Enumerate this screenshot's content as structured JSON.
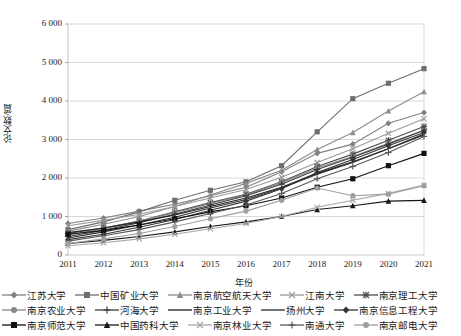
{
  "chart_data": {
    "type": "line",
    "title": "",
    "xlabel": "年份",
    "ylabel": "论文数/篇",
    "x": [
      2011,
      2012,
      2013,
      2014,
      2015,
      2016,
      2017,
      2018,
      2019,
      2020,
      2021
    ],
    "categories": [
      "2011",
      "2012",
      "2013",
      "2014",
      "2015",
      "2016",
      "2017",
      "2018",
      "2019",
      "2020",
      "2021"
    ],
    "ylim": [
      0,
      6000
    ],
    "ytick_values": [
      0,
      1000,
      2000,
      3000,
      4000,
      5000,
      6000
    ],
    "ytick_labels": [
      "0",
      "1 000",
      "2 000",
      "3 000",
      "4 000",
      "5 000",
      "6 000"
    ],
    "grid": "horizontal",
    "legend_position": "bottom",
    "series": [
      {
        "name": "江苏大学",
        "marker": "diamond",
        "color": "#808080",
        "values": [
          820,
          960,
          1140,
          1320,
          1540,
          1760,
          2160,
          2640,
          2880,
          3420,
          3700
        ]
      },
      {
        "name": "中国矿业大学",
        "marker": "square",
        "color": "#6e6e6e",
        "values": [
          660,
          860,
          1120,
          1420,
          1680,
          1900,
          2320,
          3200,
          4060,
          4460,
          4840
        ]
      },
      {
        "name": "南京航空航天大学",
        "marker": "triangle",
        "color": "#8c8c8c",
        "values": [
          620,
          800,
          1000,
          1260,
          1560,
          1860,
          2200,
          2740,
          3180,
          3740,
          4240
        ]
      },
      {
        "name": "江南大学",
        "marker": "x",
        "color": "#9a9a9a",
        "values": [
          760,
          900,
          1060,
          1260,
          1480,
          1700,
          2020,
          2400,
          2760,
          3160,
          3540
        ]
      },
      {
        "name": "南京理工大学",
        "marker": "star",
        "color": "#4d4d4d",
        "values": [
          560,
          700,
          880,
          1120,
          1360,
          1580,
          1900,
          2300,
          2620,
          2980,
          3340
        ]
      },
      {
        "name": "南京农业大学",
        "marker": "circle",
        "color": "#878787",
        "values": [
          520,
          680,
          880,
          1100,
          1340,
          1560,
          1880,
          2260,
          2560,
          2900,
          3240
        ]
      },
      {
        "name": "河海大学",
        "marker": "plus",
        "color": "#3f3f3f",
        "values": [
          480,
          640,
          840,
          1060,
          1300,
          1540,
          1840,
          2220,
          2540,
          2880,
          3240
        ]
      },
      {
        "name": "南京工业大学",
        "marker": "line",
        "color": "#202020",
        "values": [
          580,
          700,
          860,
          1040,
          1260,
          1480,
          1760,
          2120,
          2420,
          2760,
          3140
        ]
      },
      {
        "name": "扬州大学",
        "marker": "line",
        "color": "#2e2e2e",
        "values": [
          440,
          600,
          780,
          980,
          1220,
          1440,
          1740,
          2100,
          2400,
          2760,
          3120
        ]
      },
      {
        "name": "南京信息工程大学",
        "marker": "diamond",
        "color": "#343434",
        "values": [
          400,
          540,
          720,
          920,
          1160,
          1400,
          1720,
          2140,
          2480,
          2840,
          3180
        ]
      },
      {
        "name": "南京师范大学",
        "marker": "square",
        "color": "#111111",
        "values": [
          540,
          640,
          780,
          940,
          1120,
          1280,
          1480,
          1760,
          1980,
          2320,
          2640
        ]
      },
      {
        "name": "中国药科大学",
        "marker": "triangle",
        "color": "#161616",
        "values": [
          300,
          380,
          480,
          600,
          740,
          860,
          1000,
          1180,
          1280,
          1400,
          1420
        ]
      },
      {
        "name": "南京林业大学",
        "marker": "x",
        "color": "#a8a8a8",
        "values": [
          240,
          320,
          420,
          540,
          680,
          820,
          1000,
          1240,
          1420,
          1600,
          1820
        ]
      },
      {
        "name": "南通大学",
        "marker": "plus",
        "color": "#595959",
        "values": [
          360,
          500,
          660,
          860,
          1080,
          1300,
          1600,
          1980,
          2300,
          2660,
          3080
        ]
      },
      {
        "name": "南京邮电大学",
        "marker": "circle",
        "color": "#9e9e9e",
        "values": [
          300,
          420,
          560,
          740,
          940,
          1140,
          1420,
          1740,
          1540,
          1580,
          1800
        ]
      }
    ]
  },
  "axes": {
    "ylabel": "论文数/篇",
    "xlabel": "年份"
  },
  "legend": {
    "rows": [
      [
        {
          "label": "江苏大学",
          "marker": "diamond",
          "color": "#808080"
        },
        {
          "label": "中国矿业大学",
          "marker": "square",
          "color": "#6e6e6e"
        },
        {
          "label": "南京航空航天大学",
          "marker": "triangle",
          "color": "#8c8c8c"
        },
        {
          "label": "江南大学",
          "marker": "x",
          "color": "#9a9a9a"
        },
        {
          "label": "南京理工大学",
          "marker": "star",
          "color": "#4d4d4d"
        }
      ],
      [
        {
          "label": "南京农业大学",
          "marker": "circle",
          "color": "#878787"
        },
        {
          "label": "河海大学",
          "marker": "plus",
          "color": "#3f3f3f"
        },
        {
          "label": "南京工业大学",
          "marker": "line",
          "color": "#202020"
        },
        {
          "label": "扬州大学",
          "marker": "line",
          "color": "#2e2e2e"
        },
        {
          "label": "南京信息工程大学",
          "marker": "diamond",
          "color": "#343434"
        }
      ],
      [
        {
          "label": "南京师范大学",
          "marker": "square",
          "color": "#111111"
        },
        {
          "label": "中国药科大学",
          "marker": "triangle",
          "color": "#161616"
        },
        {
          "label": "南京林业大学",
          "marker": "x",
          "color": "#a8a8a8"
        },
        {
          "label": "南通大学",
          "marker": "plus",
          "color": "#595959"
        },
        {
          "label": "南京邮电大学",
          "marker": "circle",
          "color": "#9e9e9e"
        }
      ]
    ]
  }
}
